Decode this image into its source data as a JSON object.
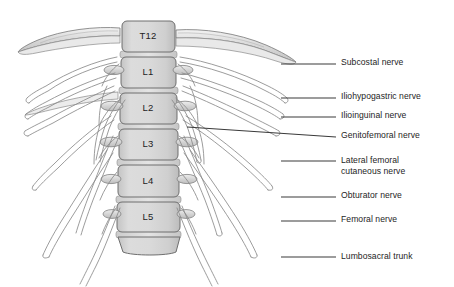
{
  "figure": {
    "background_color": "#ffffff",
    "width": 454,
    "height": 287
  },
  "palette": {
    "bone_fill": "#d6d6d6",
    "bone_fill_light": "#e6e6e6",
    "bone_fill_dark": "#bdbdbd",
    "bone_outline": "#6e6e6e",
    "nerve_outline": "#8a8a8a",
    "nerve_fill": "#fcfcfc",
    "leader_line": "#3a3a3a",
    "text": "#1e1e1e"
  },
  "vertebrae": [
    {
      "label": "T12",
      "x": 148,
      "y": 36
    },
    {
      "label": "L1",
      "x": 148,
      "y": 72
    },
    {
      "label": "L2",
      "x": 148,
      "y": 107
    },
    {
      "label": "L3",
      "x": 148,
      "y": 143
    },
    {
      "label": "L4",
      "x": 148,
      "y": 180
    },
    {
      "label": "L5",
      "x": 148,
      "y": 216
    }
  ],
  "callouts": [
    {
      "id": "subcostal-nerve",
      "label": "Subcostal nerve",
      "text_x": 341,
      "text_y": 57,
      "leader": {
        "x1": 281,
        "y1": 64,
        "x2": 336,
        "y2": 64
      }
    },
    {
      "id": "iliohypogastric-nerve",
      "label": "Iliohypogastric nerve",
      "text_x": 341,
      "text_y": 91,
      "leader": {
        "x1": 281,
        "y1": 98,
        "x2": 336,
        "y2": 98
      }
    },
    {
      "id": "ilioinguinal-nerve",
      "label": "Ilioinguinal nerve",
      "text_x": 341,
      "text_y": 110,
      "leader": {
        "x1": 281,
        "y1": 117,
        "x2": 336,
        "y2": 117
      }
    },
    {
      "id": "genitofemoral-nerve",
      "label": "Genitofemoral nerve",
      "text_x": 341,
      "text_y": 130,
      "leader": {
        "x1": 187,
        "y1": 127,
        "x2": 336,
        "y2": 137
      }
    },
    {
      "id": "lateral-femoral-cutaneous-nerve",
      "label": "Lateral femoral\ncutaneous nerve",
      "text_x": 341,
      "text_y": 155,
      "leader": {
        "x1": 281,
        "y1": 161,
        "x2": 336,
        "y2": 161
      }
    },
    {
      "id": "obturator-nerve",
      "label": "Obturator nerve",
      "text_x": 341,
      "text_y": 190,
      "leader": {
        "x1": 281,
        "y1": 197,
        "x2": 336,
        "y2": 197
      }
    },
    {
      "id": "femoral-nerve",
      "label": "Femoral nerve",
      "text_x": 341,
      "text_y": 214,
      "leader": {
        "x1": 281,
        "y1": 221,
        "x2": 336,
        "y2": 221
      }
    },
    {
      "id": "lumbosacral-trunk",
      "label": "Lumbosacral trunk",
      "text_x": 341,
      "text_y": 251,
      "leader": {
        "x1": 281,
        "y1": 257,
        "x2": 336,
        "y2": 257
      }
    }
  ],
  "structures": [
    {
      "id": "twelfth-rib-left",
      "name": "12th rib (left)"
    },
    {
      "id": "twelfth-rib-right",
      "name": "12th rib (right)"
    },
    {
      "id": "transverse-processes",
      "name": "Transverse processes"
    },
    {
      "id": "nerve-roots",
      "name": "Spinal nerve roots"
    },
    {
      "id": "lumbar-plexus",
      "name": "Lumbar plexus"
    }
  ]
}
